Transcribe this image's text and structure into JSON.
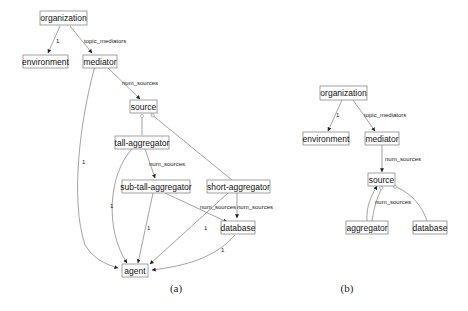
{
  "panels": [
    {
      "id": "a",
      "caption": "(a)",
      "nodes": {
        "organization": "organization",
        "environment": "environment",
        "mediator": "mediator",
        "source": "source",
        "tall_aggregator": "tall-aggregator",
        "sub_tall_aggregator": "sub-tall-aggregator",
        "short_aggregator": "short-aggregator",
        "database": "database",
        "agent": "agent"
      },
      "edge_labels": {
        "org_env": "1",
        "org_med": "topic_mediators",
        "med_src": "num_sources",
        "med_agent": "1",
        "tall_sub": "num_sources",
        "tall_agent": "1",
        "sub_agent": "1",
        "sub_db": "num_sources",
        "short_db": "num_sources",
        "short_agent": "1",
        "db_agent": "1"
      }
    },
    {
      "id": "b",
      "caption": "(b)",
      "nodes": {
        "organization": "organization",
        "environment": "environment",
        "mediator": "mediator",
        "source": "source",
        "aggregator": "aggregator",
        "database": "database"
      },
      "edge_labels": {
        "org_env": "1",
        "org_med": "topic_mediators",
        "med_src": "num_sources",
        "agg_src": "num_sources"
      }
    }
  ]
}
